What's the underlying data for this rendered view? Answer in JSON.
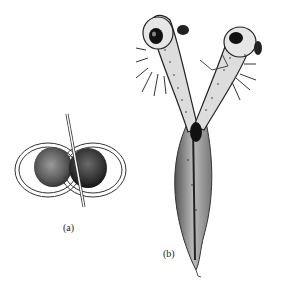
{
  "figure": {
    "panels": [
      {
        "id": "a",
        "label": "(a)",
        "description": "Two spherical embryos joined side by side, each surrounded by concentric membranes, with a thin rod passing between them"
      },
      {
        "id": "b",
        "label": "(b)",
        "description": "Two-headed tadpole larva with heads diverging in a V shape and a single shared tapering tail"
      }
    ]
  }
}
